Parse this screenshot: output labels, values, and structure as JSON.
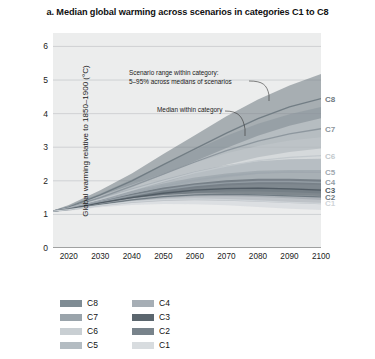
{
  "title": "a. Median global warming across scenarios in categories C1 to C8",
  "axes": {
    "ylabel": "Global warming relative to 1850–1900 (°C)",
    "yticks": [
      "0",
      "1",
      "2",
      "3",
      "4",
      "5",
      "6"
    ],
    "xticks": [
      "2020",
      "2030",
      "2040",
      "2050",
      "2060",
      "2070",
      "2080",
      "2090",
      "2100"
    ]
  },
  "annotations": {
    "range_line1": "Scenario range within category:",
    "range_line2": "5–95% across medians of scenarios",
    "median": "Median within category"
  },
  "legend": {
    "left": [
      {
        "label": "C8",
        "color": "#7f8c94"
      },
      {
        "label": "C7",
        "color": "#9aa4ab"
      },
      {
        "label": "C6",
        "color": "#c9cfd3"
      },
      {
        "label": "C5",
        "color": "#b4bcc2"
      },
      {
        "label": "C4",
        "color": "#a6aeb5"
      },
      {
        "label": "C3",
        "color": "#5b666e"
      },
      {
        "label": "C2",
        "color": "#78838b"
      },
      {
        "label": "C1",
        "color": "#d8dcdf"
      }
    ]
  },
  "edge_labels": [
    {
      "label": "C8",
      "color": "#6f7a82",
      "value": 4.45
    },
    {
      "label": "C7",
      "color": "#8b959c",
      "value": 3.55
    },
    {
      "label": "C6",
      "color": "#c2c8cc",
      "value": 2.75
    },
    {
      "label": "C5",
      "color": "#9fa8af",
      "value": 2.25
    },
    {
      "label": "C4",
      "color": "#949da4",
      "value": 1.95
    },
    {
      "label": "C3",
      "color": "#4f5a62",
      "value": 1.72
    },
    {
      "label": "C2",
      "color": "#6d7880",
      "value": 1.52
    },
    {
      "label": "C1",
      "color": "#cfd4d8",
      "value": 1.33
    }
  ],
  "chart_data": {
    "type": "area",
    "title": "a. Median global warming across scenarios in categories C1 to C8",
    "xlabel": "",
    "ylabel": "Global warming relative to 1850–1900 (°C)",
    "xlim": [
      2015,
      2100
    ],
    "ylim": [
      0,
      6.4
    ],
    "x": [
      2015,
      2020,
      2030,
      2040,
      2050,
      2060,
      2070,
      2080,
      2090,
      2100
    ],
    "grid": true,
    "legend_position": "below-plot",
    "band_description": "Shaded band = scenario range within category (5–95% across medians of scenarios); solid line = median within category",
    "series": [
      {
        "name": "C8",
        "color": "#6f7a82",
        "median": [
          1.1,
          1.22,
          1.58,
          2.0,
          2.48,
          2.95,
          3.42,
          3.85,
          4.2,
          4.45
        ],
        "lower": [
          1.08,
          1.18,
          1.46,
          1.8,
          2.18,
          2.58,
          2.98,
          3.34,
          3.64,
          3.86
        ],
        "upper": [
          1.12,
          1.28,
          1.72,
          2.22,
          2.8,
          3.36,
          3.92,
          4.42,
          4.84,
          5.18
        ]
      },
      {
        "name": "C7",
        "color": "#8b959c",
        "median": [
          1.1,
          1.2,
          1.5,
          1.84,
          2.2,
          2.56,
          2.9,
          3.18,
          3.4,
          3.55
        ],
        "lower": [
          1.08,
          1.16,
          1.4,
          1.66,
          1.94,
          2.22,
          2.48,
          2.7,
          2.86,
          2.96
        ],
        "upper": [
          1.12,
          1.26,
          1.62,
          2.04,
          2.48,
          2.92,
          3.34,
          3.7,
          3.98,
          4.2
        ]
      },
      {
        "name": "C6",
        "color": "#c2c8cc",
        "median": [
          1.1,
          1.19,
          1.45,
          1.72,
          1.99,
          2.24,
          2.44,
          2.6,
          2.7,
          2.75
        ],
        "lower": [
          1.08,
          1.15,
          1.36,
          1.58,
          1.78,
          1.96,
          2.1,
          2.2,
          2.26,
          2.28
        ],
        "upper": [
          1.12,
          1.24,
          1.56,
          1.88,
          2.22,
          2.54,
          2.82,
          3.04,
          3.2,
          3.3
        ]
      },
      {
        "name": "C5",
        "color": "#9fa8af",
        "median": [
          1.1,
          1.18,
          1.4,
          1.63,
          1.84,
          2.02,
          2.15,
          2.23,
          2.26,
          2.25
        ],
        "lower": [
          1.08,
          1.14,
          1.32,
          1.5,
          1.66,
          1.78,
          1.86,
          1.9,
          1.9,
          1.88
        ],
        "upper": [
          1.12,
          1.23,
          1.5,
          1.78,
          2.04,
          2.28,
          2.46,
          2.58,
          2.64,
          2.66
        ]
      },
      {
        "name": "C4",
        "color": "#949da4",
        "median": [
          1.1,
          1.17,
          1.37,
          1.56,
          1.73,
          1.86,
          1.94,
          1.98,
          1.98,
          1.95
        ],
        "lower": [
          1.08,
          1.13,
          1.29,
          1.44,
          1.56,
          1.64,
          1.68,
          1.68,
          1.66,
          1.62
        ],
        "upper": [
          1.12,
          1.22,
          1.46,
          1.7,
          1.92,
          2.1,
          2.22,
          2.3,
          2.32,
          2.32
        ]
      },
      {
        "name": "C3",
        "color": "#4f5a62",
        "median": [
          1.1,
          1.16,
          1.34,
          1.5,
          1.63,
          1.72,
          1.77,
          1.78,
          1.76,
          1.72
        ],
        "lower": [
          1.08,
          1.13,
          1.27,
          1.39,
          1.48,
          1.53,
          1.54,
          1.52,
          1.48,
          1.43
        ],
        "upper": [
          1.12,
          1.21,
          1.42,
          1.62,
          1.8,
          1.93,
          2.02,
          2.06,
          2.06,
          2.04
        ]
      },
      {
        "name": "C2",
        "color": "#6d7880",
        "median": [
          1.1,
          1.15,
          1.3,
          1.43,
          1.53,
          1.58,
          1.6,
          1.58,
          1.55,
          1.52
        ],
        "lower": [
          1.08,
          1.12,
          1.24,
          1.34,
          1.4,
          1.42,
          1.41,
          1.38,
          1.34,
          1.3
        ],
        "upper": [
          1.12,
          1.2,
          1.38,
          1.54,
          1.68,
          1.76,
          1.8,
          1.8,
          1.78,
          1.76
        ]
      },
      {
        "name": "C1",
        "color": "#cfd4d8",
        "median": [
          1.1,
          1.14,
          1.27,
          1.38,
          1.44,
          1.46,
          1.44,
          1.4,
          1.36,
          1.33
        ],
        "lower": [
          1.08,
          1.11,
          1.21,
          1.28,
          1.31,
          1.3,
          1.27,
          1.22,
          1.17,
          1.13
        ],
        "upper": [
          1.12,
          1.19,
          1.35,
          1.48,
          1.58,
          1.62,
          1.62,
          1.6,
          1.57,
          1.55
        ]
      }
    ]
  }
}
